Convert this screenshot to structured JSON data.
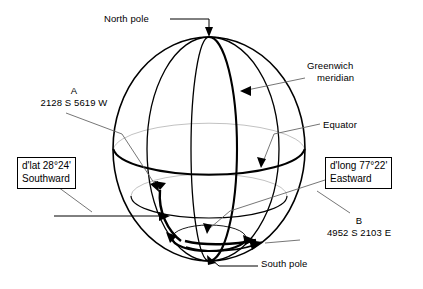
{
  "figure": {
    "type": "globe-diagram"
  },
  "labels": {
    "north_pole": "North pole",
    "south_pole": "South pole",
    "equator": "Equator",
    "greenwich_line1": "Greenwich",
    "greenwich_line2": "meridian"
  },
  "points": {
    "a": {
      "name": "A",
      "position": "2128 S 5619 W"
    },
    "b": {
      "name": "B",
      "position": "4952 S 2103 E"
    }
  },
  "boxes": {
    "dlat": {
      "line1": "d'lat 28°24'",
      "line2": "Southward"
    },
    "dlong": {
      "line1": "d'long 77°22'",
      "line2": "Eastward"
    }
  },
  "colors": {
    "stroke": "#000000",
    "leader": "#555555",
    "background": "#ffffff"
  }
}
